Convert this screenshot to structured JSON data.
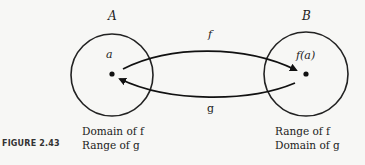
{
  "figure": {
    "caption": "FIGURE 2.43"
  },
  "set_a": {
    "name": "A",
    "element": "a",
    "desc_line1": "Domain of f",
    "desc_line2": "Range of g"
  },
  "set_b": {
    "name": "B",
    "element": "f(a)",
    "desc_line1": "Range of f",
    "desc_line2": "Domain of g"
  },
  "arrows": {
    "forward": "f",
    "backward": "g"
  }
}
